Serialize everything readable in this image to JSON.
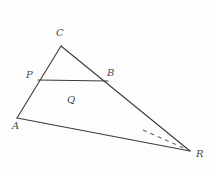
{
  "figure": {
    "type": "geometry-diagram",
    "background_color": "#fdfdfd",
    "stroke_color": "#3b3b3b",
    "label_color": "#4a4a4a",
    "stroke_width": 1.1,
    "width": 216,
    "height": 173
  },
  "points": [
    {
      "id": "A",
      "label": "A",
      "x": 17,
      "y": 118,
      "label_x": 12,
      "label_y": 121
    },
    {
      "id": "C",
      "label": "C",
      "x": 61,
      "y": 46,
      "label_x": 56,
      "label_y": 28
    },
    {
      "id": "P",
      "label": "P",
      "x": 38,
      "y": 80,
      "label_x": 26,
      "label_y": 70
    },
    {
      "id": "B",
      "label": "B",
      "x": 108,
      "y": 81,
      "label_x": 107,
      "label_y": 68
    },
    {
      "id": "Q",
      "label": "Q",
      "x": 72,
      "y": 92,
      "label_x": 67,
      "label_y": 95
    },
    {
      "id": "R",
      "label": "R",
      "x": 190,
      "y": 151,
      "label_x": 196,
      "label_y": 149
    }
  ],
  "segments": [
    {
      "id": "A-C",
      "name": "segment-a-c",
      "from": "A",
      "to": "C",
      "style": "solid"
    },
    {
      "id": "C-R",
      "name": "segment-c-r",
      "from": "C",
      "to": "R",
      "style": "solid"
    },
    {
      "id": "A-R",
      "name": "segment-a-r",
      "from": "A",
      "to": "R",
      "style": "solid"
    },
    {
      "id": "P-B",
      "name": "segment-p-b",
      "from": "P",
      "to": "B",
      "style": "solid"
    }
  ],
  "dashed_segments": [
    {
      "id": "dash-1",
      "name": "dashed-extension-to-r",
      "x1": 143,
      "y1": 130,
      "x2": 188,
      "y2": 150,
      "dash_pattern": "4 4"
    }
  ]
}
